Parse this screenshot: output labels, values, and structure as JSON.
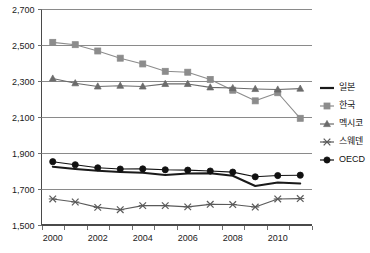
{
  "chart_data": {
    "type": "line",
    "title": "",
    "subtitle": "",
    "xlabel": "",
    "ylabel": "",
    "x": [
      2000,
      2001,
      2002,
      2003,
      2004,
      2005,
      2006,
      2007,
      2008,
      2009,
      2010,
      2011
    ],
    "x_tick_labels": [
      "2000",
      "2002",
      "2004",
      "2006",
      "2008",
      "2010"
    ],
    "x_tick_values": [
      2000,
      2002,
      2004,
      2006,
      2008,
      2010
    ],
    "y_tick_labels": [
      "1,500",
      "1,700",
      "1,900",
      "2,100",
      "2,300",
      "2,500",
      "2,700"
    ],
    "y_tick_values": [
      1500,
      1700,
      1900,
      2100,
      2300,
      2500,
      2700
    ],
    "ylim": [
      1500,
      2700
    ],
    "grid": "horizontal",
    "legend_position": "right",
    "series": [
      {
        "name": "일본",
        "marker": "none",
        "color": "#1a1a1a",
        "values": [
          1821,
          1809,
          1798,
          1792,
          1787,
          1775,
          1784,
          1785,
          1771,
          1714,
          1733,
          1728
        ]
      },
      {
        "name": "한국",
        "marker": "square",
        "color": "#8c8c8c",
        "values": [
          2512,
          2499,
          2464,
          2424,
          2392,
          2351,
          2346,
          2306,
          2246,
          2187,
          2232,
          2090
        ]
      },
      {
        "name": "멕시코",
        "marker": "triangle",
        "color": "#6b6b6b",
        "values": [
          2311,
          2285,
          2267,
          2271,
          2267,
          2281,
          2281,
          2262,
          2258,
          2253,
          2250,
          2255
        ]
      },
      {
        "name": "스웨덴",
        "marker": "cross",
        "color": "#5a5a5a",
        "values": [
          1642,
          1625,
          1595,
          1582,
          1605,
          1605,
          1598,
          1612,
          1611,
          1597,
          1642,
          1644
        ]
      },
      {
        "name": "OECD",
        "marker": "circle",
        "color": "#111111",
        "values": [
          1849,
          1832,
          1815,
          1808,
          1809,
          1804,
          1802,
          1797,
          1791,
          1765,
          1772,
          1774
        ]
      }
    ]
  },
  "legend": {
    "items": [
      {
        "label": "일본"
      },
      {
        "label": "한국"
      },
      {
        "label": "멕시코"
      },
      {
        "label": "스웨덴"
      },
      {
        "label": "OECD"
      }
    ]
  }
}
